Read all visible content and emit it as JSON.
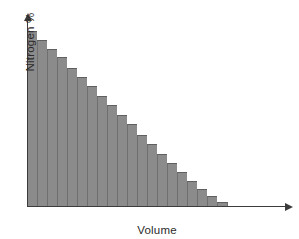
{
  "chart_data": {
    "type": "bar",
    "title": "",
    "subtitle": "",
    "xlabel": "Volume",
    "ylabel": "Nitrogen %",
    "grid": false,
    "legend": null,
    "tick_labels": {
      "x": [],
      "y": []
    },
    "axis_style": "arrow-axes, no ticks, no tick labels",
    "xlim": [
      0,
      26
    ],
    "ylim": [
      0,
      100
    ],
    "categories": [
      1,
      2,
      3,
      4,
      5,
      6,
      7,
      8,
      9,
      10,
      11,
      12,
      13,
      14,
      15,
      16,
      17,
      18,
      19,
      20
    ],
    "values": [
      100,
      95,
      90,
      85,
      79,
      74,
      69,
      63,
      58,
      52,
      47,
      41,
      36,
      30,
      25,
      20,
      15,
      10,
      6,
      3
    ],
    "annotations": []
  },
  "figure": {
    "background_color": "#ffffff",
    "bar_fill_color": "#8b8b8b",
    "bar_edge_color": "#6f6f6f",
    "axis_color": "#3c3c3c",
    "text_color": "#2b2b2b"
  }
}
